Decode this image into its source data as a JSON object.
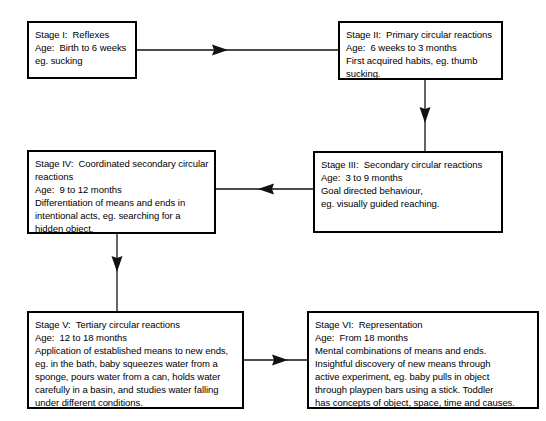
{
  "diagram": {
    "background_color": "#ffffff",
    "line_color": "#111111",
    "border_color": "#000000",
    "nodes": [
      {
        "id": "stage-1",
        "lines": [
          "Stage I:  Reflexes",
          "Age:  Birth to 6 weeks",
          "eg. sucking"
        ]
      },
      {
        "id": "stage-2",
        "lines": [
          "Stage II:  Primary circular reactions",
          "Age:  6 weeks to 3 months",
          "First acquired habits, eg. thumb",
          "sucking."
        ]
      },
      {
        "id": "stage-3",
        "lines": [
          "Stage III:  Secondary circular reactions",
          "Age:  3 to 9 months",
          "Goal directed behaviour,",
          "eg. visually guided reaching."
        ]
      },
      {
        "id": "stage-4",
        "lines": [
          "Stage IV:  Coordinated secondary circular",
          "reactions",
          "Age:  9 to 12 months",
          "Differentiation of means and ends in",
          "intentional acts, eg. searching for a",
          "hidden object."
        ]
      },
      {
        "id": "stage-5",
        "lines": [
          "Stage V:  Tertiary circular reactions",
          "Age:  12 to 18 months",
          "Application of established means to new ends,",
          "eg. in the bath, baby squeezes water from a",
          "sponge, pours water from a can, holds water",
          "carefully in a basin, and studies water falling",
          "under different conditions."
        ]
      },
      {
        "id": "stage-6",
        "lines": [
          "Stage VI:  Representation",
          "Age:  From 18 months",
          "Mental combinations of means and ends.",
          "Insightful discovery of new means through",
          "active experiment, eg. baby pulls in object",
          "through playpen bars using a stick. Toddler",
          "has concepts of object, space, time and causes."
        ]
      }
    ],
    "connectors": [
      {
        "id": "stage-1-to-stage-2",
        "direction": "right"
      },
      {
        "id": "stage-2-to-stage-3",
        "direction": "down"
      },
      {
        "id": "stage-3-to-stage-4",
        "direction": "left"
      },
      {
        "id": "stage-4-to-stage-5",
        "direction": "down"
      },
      {
        "id": "stage-5-to-stage-6",
        "direction": "right"
      }
    ]
  }
}
